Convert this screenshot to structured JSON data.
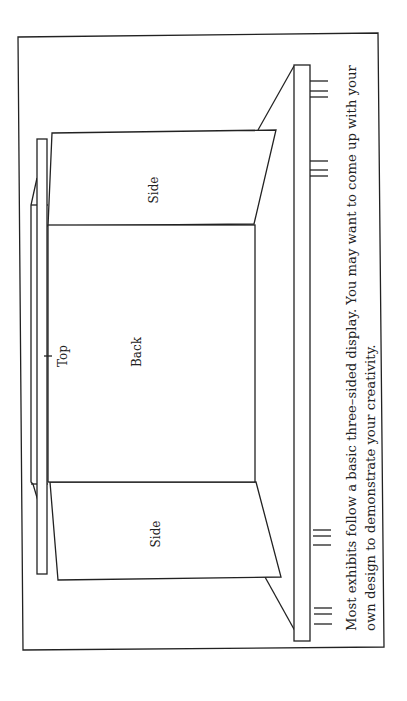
{
  "figure": {
    "orientation": "rotated-90-ccw",
    "labels": {
      "top": "Top",
      "back": "Back",
      "side_upper": "Side",
      "side_lower": "Side"
    },
    "caption": {
      "line1": "Most exhibits follow a basic three–sided display. You may want to come up with your",
      "line2": "own design to demonstrate your creativity."
    },
    "colors": {
      "line": "#222222",
      "background": "#ffffff"
    }
  }
}
